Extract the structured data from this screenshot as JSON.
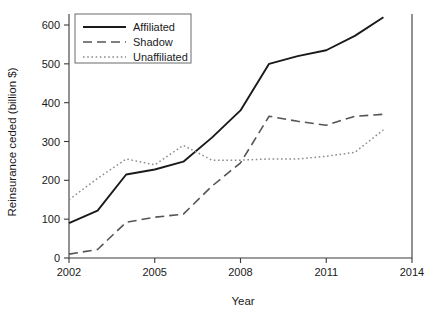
{
  "chart_data": {
    "type": "line",
    "title": "",
    "xlabel": "Year",
    "ylabel": "Reinsurance ceded (billion $)",
    "xlim": [
      2002,
      2014
    ],
    "ylim": [
      0,
      620
    ],
    "grid": false,
    "legend_position": "top-left",
    "xticks": [
      "2002",
      "2005",
      "2008",
      "2011",
      "2014"
    ],
    "xtick_values": [
      2002,
      2005,
      2008,
      2011,
      2014
    ],
    "yticks": [
      "0",
      "100",
      "200",
      "300",
      "400",
      "500",
      "600"
    ],
    "ytick_values": [
      0,
      100,
      200,
      300,
      400,
      500,
      600
    ],
    "x": [
      2002,
      2003,
      2004,
      2005,
      2006,
      2007,
      2008,
      2009,
      2010,
      2011,
      2012,
      2013
    ],
    "series": [
      {
        "name": "Affiliated",
        "style": "solid",
        "color": "#1a1a1a",
        "values": [
          90,
          122,
          215,
          228,
          248,
          310,
          380,
          500,
          520,
          535,
          572,
          620
        ]
      },
      {
        "name": "Shadow",
        "style": "dashed",
        "color": "#555555",
        "values": [
          10,
          22,
          92,
          105,
          113,
          185,
          245,
          365,
          352,
          342,
          365,
          370
        ]
      },
      {
        "name": "Unaffiliated",
        "style": "dotted",
        "color": "#8c8c8c",
        "values": [
          150,
          205,
          255,
          240,
          290,
          252,
          252,
          255,
          255,
          262,
          272,
          330
        ]
      }
    ]
  }
}
